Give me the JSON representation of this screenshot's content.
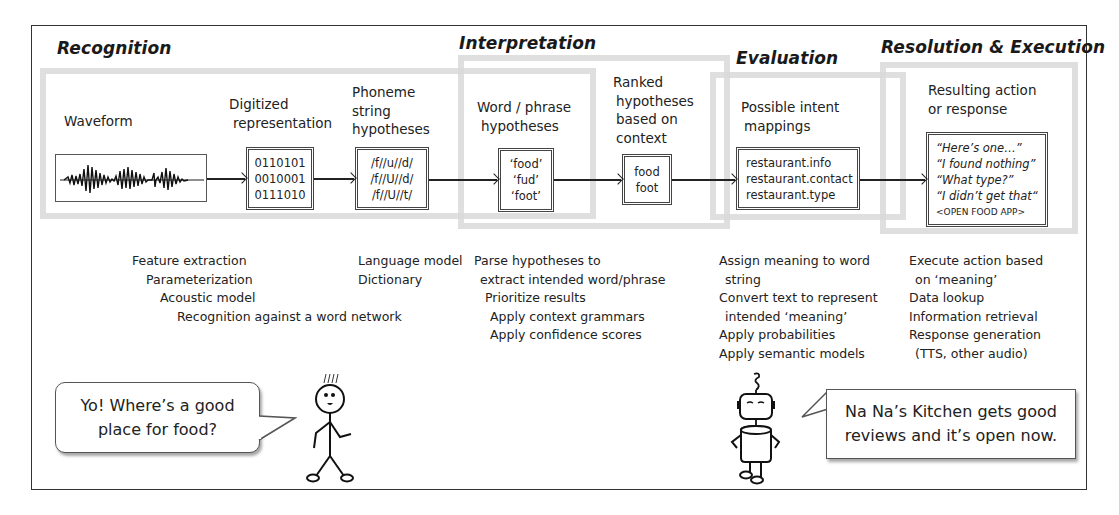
{
  "stages": {
    "recognition": {
      "title": "Recognition"
    },
    "interpretation": {
      "title": "Interpretation"
    },
    "evaluation": {
      "title": "Evaluation"
    },
    "resolution": {
      "title": "Resolution & Execution"
    }
  },
  "nodes": {
    "waveform": {
      "label": "Waveform",
      "icon": "waveform-icon"
    },
    "digitized": {
      "label_lines": [
        "Digitized",
        "representation"
      ],
      "values": [
        "0110101",
        "0010001",
        "0111010"
      ]
    },
    "phoneme": {
      "label_lines": [
        "Phoneme",
        "string",
        "hypotheses"
      ],
      "values": [
        "/f//u//d/",
        "/f//U//d/",
        "/f//U//t/"
      ]
    },
    "word": {
      "label_lines": [
        "Word / phrase",
        "hypotheses"
      ],
      "values": [
        "‘food’",
        "‘fud’",
        "‘foot’"
      ]
    },
    "ranked": {
      "label_lines": [
        "Ranked",
        "hypotheses",
        "based on",
        "context"
      ],
      "values": [
        "food",
        "foot"
      ]
    },
    "intent": {
      "label_lines": [
        "Possible intent",
        "mappings"
      ],
      "values": [
        "restaurant.info",
        "restaurant.contact",
        "restaurant.type"
      ]
    },
    "result": {
      "label_lines": [
        "Resulting action",
        "or response"
      ],
      "values": [
        "“Here’s one…”",
        "“I found nothing”",
        "“What type?”",
        "“I didn’t get that“"
      ],
      "command": "<OPEN FOOD APP>"
    }
  },
  "descriptions": {
    "recognition_acoustic": [
      "Feature extraction",
      "Parameterization",
      "Acoustic model",
      "Recognition against a word network"
    ],
    "recognition_language": [
      "Language model",
      "Dictionary"
    ],
    "interpretation": [
      "Parse hypotheses to",
      "extract intended word/phrase",
      "Prioritize results",
      "Apply context grammars",
      "Apply confidence scores"
    ],
    "evaluation": [
      "Assign meaning to word",
      "string",
      "Convert text to represent",
      "intended ‘meaning’",
      "Apply probabilities",
      "Apply semantic models"
    ],
    "resolution": [
      "Execute action based",
      "on ‘meaning’",
      "Data lookup",
      "Information retrieval",
      "Response generation",
      "(TTS, other audio)"
    ]
  },
  "dialogue": {
    "user": {
      "text_lines": [
        "Yo! Where’s a good",
        "place for food?"
      ],
      "avatar": "stick-figure-icon"
    },
    "assistant": {
      "text_lines": [
        "Na Na’s Kitchen gets good",
        "reviews and it’s open now."
      ],
      "avatar": "robot-icon"
    }
  },
  "colors": {
    "stage_border": "#d9d9d9",
    "line": "#222222",
    "frame": "#333333"
  }
}
